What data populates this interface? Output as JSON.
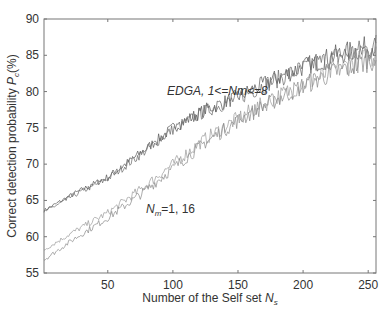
{
  "chart_data": {
    "type": "line",
    "title": "",
    "xlabel": "Number of the Self set N_s",
    "xlabel_main": "Number of the Self set ",
    "xlabel_sym": "N",
    "xlabel_sub": "s",
    "ylabel": "Correct detection probability P_c(%)",
    "ylabel_main": "Correct detection probability ",
    "ylabel_sym": "P",
    "ylabel_sub": "c",
    "ylabel_tail": "(%)",
    "xlim": [
      1,
      256
    ],
    "ylim": [
      55,
      90
    ],
    "xticks": [
      50,
      100,
      150,
      200,
      250
    ],
    "yticks": [
      55,
      60,
      65,
      70,
      75,
      80,
      85,
      90
    ],
    "grid": false,
    "annotations": [
      {
        "text": "EDGA, 1<=Nm<=8",
        "x": 100,
        "y": 80.5
      },
      {
        "text_sym": "N",
        "text_sub": "m",
        "text_tail": "=1,  16",
        "x": 92,
        "y": 64
      }
    ],
    "x": [
      1,
      25,
      50,
      75,
      100,
      125,
      150,
      175,
      200,
      225,
      256
    ],
    "series": [
      {
        "name": "EDGA, Nm=1",
        "group": "EDGA, 1<=Nm<=8",
        "color": "#555555",
        "values": [
          63.6,
          66.0,
          68.2,
          71.5,
          75.0,
          77.5,
          79.3,
          81.5,
          83.4,
          85.0,
          86.4
        ]
      },
      {
        "name": "EDGA, Nm=8",
        "group": "EDGA, 1<=Nm<=8",
        "color": "#666666",
        "values": [
          63.4,
          65.8,
          68.0,
          71.3,
          74.8,
          77.3,
          79.1,
          81.3,
          83.2,
          84.8,
          86.2
        ]
      },
      {
        "name": "Nm=1",
        "group": "Nm=1, 16",
        "color": "#999999",
        "values": [
          58.2,
          60.8,
          63.3,
          66.5,
          70.0,
          73.5,
          76.3,
          78.8,
          81.0,
          83.0,
          85.0
        ]
      },
      {
        "name": "Nm=16",
        "group": "Nm=1, 16",
        "color": "#888888",
        "values": [
          56.8,
          59.8,
          62.6,
          65.8,
          69.4,
          73.0,
          76.0,
          78.5,
          80.8,
          82.8,
          84.6
        ]
      }
    ]
  }
}
